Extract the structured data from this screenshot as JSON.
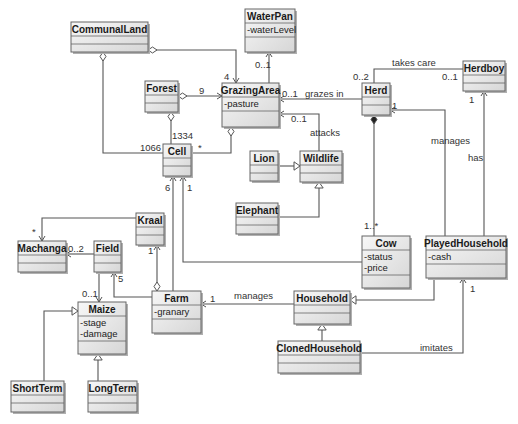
{
  "diagram": {
    "type": "UML class diagram",
    "classes": [
      {
        "id": "CommunalLand",
        "name": "CommunalLand",
        "attrs": [],
        "x": 71,
        "y": 22,
        "w": 77,
        "h": 30
      },
      {
        "id": "WaterPan",
        "name": "WaterPan",
        "attrs": [
          "-waterLevel"
        ],
        "x": 245,
        "y": 9,
        "w": 50,
        "h": 43
      },
      {
        "id": "Forest",
        "name": "Forest",
        "attrs": [],
        "x": 145,
        "y": 81,
        "w": 33,
        "h": 31
      },
      {
        "id": "GrazingArea",
        "name": "GrazingArea",
        "attrs": [
          "-pasture"
        ],
        "x": 222,
        "y": 83,
        "w": 57,
        "h": 44
      },
      {
        "id": "Herd",
        "name": "Herd",
        "attrs": [],
        "x": 362,
        "y": 83,
        "w": 28,
        "h": 32
      },
      {
        "id": "Herdboy",
        "name": "Herdboy",
        "attrs": [],
        "x": 463,
        "y": 61,
        "w": 42,
        "h": 30
      },
      {
        "id": "Cell",
        "name": "Cell",
        "attrs": [],
        "x": 163,
        "y": 144,
        "w": 28,
        "h": 32
      },
      {
        "id": "Lion",
        "name": "Lion",
        "attrs": [],
        "x": 250,
        "y": 151,
        "w": 28,
        "h": 30
      },
      {
        "id": "Wildlife",
        "name": "Wildlife",
        "attrs": [],
        "x": 300,
        "y": 151,
        "w": 42,
        "h": 31
      },
      {
        "id": "Elephant",
        "name": "Elephant",
        "attrs": [],
        "x": 236,
        "y": 203,
        "w": 42,
        "h": 31
      },
      {
        "id": "Kraal",
        "name": "Kraal",
        "attrs": [],
        "x": 136,
        "y": 213,
        "w": 28,
        "h": 32
      },
      {
        "id": "Machanga",
        "name": "Machanga",
        "attrs": [],
        "x": 18,
        "y": 241,
        "w": 48,
        "h": 31
      },
      {
        "id": "Field",
        "name": "Field",
        "attrs": [],
        "x": 94,
        "y": 241,
        "w": 27,
        "h": 31
      },
      {
        "id": "Cow",
        "name": "Cow",
        "attrs": [
          "-status",
          "-price"
        ],
        "x": 362,
        "y": 236,
        "w": 48,
        "h": 52
      },
      {
        "id": "PlayedHousehold",
        "name": "PlayedHousehold",
        "attrs": [
          "-cash"
        ],
        "x": 426,
        "y": 236,
        "w": 80,
        "h": 42
      },
      {
        "id": "Maize",
        "name": "Maize",
        "attrs": [
          "-stage",
          "-damage"
        ],
        "x": 78,
        "y": 302,
        "w": 48,
        "h": 52
      },
      {
        "id": "Farm",
        "name": "Farm",
        "attrs": [
          "-granary"
        ],
        "x": 152,
        "y": 291,
        "w": 49,
        "h": 42
      },
      {
        "id": "Household",
        "name": "Household",
        "attrs": [],
        "x": 294,
        "y": 291,
        "w": 56,
        "h": 33
      },
      {
        "id": "ClonedHousehold",
        "name": "ClonedHousehold",
        "attrs": [],
        "x": 278,
        "y": 341,
        "w": 82,
        "h": 32
      },
      {
        "id": "ShortTerm",
        "name": "ShortTerm",
        "attrs": [],
        "x": 11,
        "y": 381,
        "w": 53,
        "h": 31
      },
      {
        "id": "LongTerm",
        "name": "LongTerm",
        "attrs": [],
        "x": 88,
        "y": 381,
        "w": 49,
        "h": 31
      }
    ],
    "edges": [
      {
        "from": "CommunalLand",
        "to": "GrazingArea",
        "kind": "aggregation-navigable",
        "points": [
          [
            148,
            50
          ],
          [
            236,
            50
          ],
          [
            236,
            83
          ]
        ],
        "labels": [
          {
            "text": "4",
            "x": 224,
            "y": 80
          }
        ]
      },
      {
        "from": "CommunalLand",
        "to": "Cell",
        "kind": "aggregation",
        "points": [
          [
            103,
            52
          ],
          [
            103,
            153
          ],
          [
            163,
            153
          ]
        ],
        "labels": [
          {
            "text": "1066",
            "x": 140,
            "y": 151
          }
        ]
      },
      {
        "from": "WaterPan",
        "to": "GrazingArea",
        "kind": "association-navigable",
        "points": [
          [
            269,
            83
          ],
          [
            269,
            52
          ]
        ],
        "labels": [
          {
            "text": "0..1",
            "x": 255,
            "y": 68
          }
        ]
      },
      {
        "from": "Forest",
        "to": "GrazingArea",
        "kind": "aggregation-navigable",
        "points": [
          [
            178,
            96
          ],
          [
            222,
            96
          ]
        ],
        "labels": [
          {
            "text": "9",
            "x": 199,
            "y": 94
          }
        ]
      },
      {
        "from": "Forest",
        "to": "Cell",
        "kind": "aggregation",
        "points": [
          [
            171,
            112
          ],
          [
            171,
            144
          ]
        ],
        "labels": [
          {
            "text": "1334",
            "x": 172,
            "y": 139
          }
        ]
      },
      {
        "from": "GrazingArea",
        "to": "Cell",
        "kind": "aggregation",
        "points": [
          [
            231,
            127
          ],
          [
            231,
            153
          ],
          [
            191,
            153
          ]
        ],
        "labels": [
          {
            "text": "*",
            "x": 198,
            "y": 151
          }
        ]
      },
      {
        "from": "Herd",
        "to": "GrazingArea",
        "kind": "association-navigable",
        "label_name": "grazes in",
        "points": [
          [
            362,
            99
          ],
          [
            279,
            99
          ]
        ],
        "labels": [
          {
            "text": "0..1",
            "x": 282,
            "y": 97
          },
          {
            "text": "grazes in",
            "x": 305,
            "y": 97
          }
        ]
      },
      {
        "from": "Wildlife",
        "to": "GrazingArea",
        "kind": "association-navigable",
        "label_name": "attacks",
        "points": [
          [
            319,
            151
          ],
          [
            319,
            114
          ],
          [
            279,
            114
          ]
        ],
        "labels": [
          {
            "text": "0..1",
            "x": 291,
            "y": 122
          },
          {
            "text": "attacks",
            "x": 310,
            "y": 136
          }
        ]
      },
      {
        "from": "Herdboy",
        "to": "Herd",
        "kind": "association",
        "label_name": "takes care",
        "points": [
          [
            463,
            69
          ],
          [
            374,
            69
          ],
          [
            374,
            83
          ]
        ],
        "labels": [
          {
            "text": "takes care",
            "x": 392,
            "y": 66
          },
          {
            "text": "0..2",
            "x": 353,
            "y": 80
          },
          {
            "text": "0..1",
            "x": 442,
            "y": 80
          }
        ]
      },
      {
        "from": "Cow",
        "to": "Herd",
        "kind": "composition",
        "points": [
          [
            374,
            236
          ],
          [
            374,
            115
          ]
        ],
        "labels": [
          {
            "text": "1..*",
            "x": 364,
            "y": 229
          }
        ]
      },
      {
        "from": "PlayedHousehold",
        "to": "Herd",
        "kind": "association-navigable",
        "label_name": "manages",
        "points": [
          [
            445,
            236
          ],
          [
            445,
            110
          ],
          [
            390,
            110
          ]
        ],
        "labels": [
          {
            "text": "1",
            "x": 392,
            "y": 109
          },
          {
            "text": "manages",
            "x": 431,
            "y": 144
          }
        ]
      },
      {
        "from": "PlayedHousehold",
        "to": "Herdboy",
        "kind": "association-navigable",
        "label_name": "has",
        "points": [
          [
            484,
            236
          ],
          [
            484,
            91
          ]
        ],
        "labels": [
          {
            "text": "1",
            "x": 469,
            "y": 103
          },
          {
            "text": "has",
            "x": 468,
            "y": 161
          }
        ]
      },
      {
        "from": "Lion",
        "to": "Wildlife",
        "kind": "generalization",
        "points": [
          [
            278,
            166
          ],
          [
            300,
            166
          ]
        ],
        "labels": []
      },
      {
        "from": "Elephant",
        "to": "Wildlife",
        "kind": "generalization",
        "points": [
          [
            278,
            217
          ],
          [
            319,
            217
          ],
          [
            319,
            182
          ]
        ],
        "labels": []
      },
      {
        "from": "Cow",
        "to": "Cell",
        "kind": "association-navigable",
        "points": [
          [
            362,
            262
          ],
          [
            183,
            262
          ],
          [
            183,
            176
          ]
        ],
        "labels": [
          {
            "text": "1",
            "x": 187,
            "y": 191
          }
        ]
      },
      {
        "from": "Farm",
        "to": "Cell",
        "kind": "association-navigable",
        "points": [
          [
            173,
            291
          ],
          [
            173,
            176
          ]
        ],
        "labels": [
          {
            "text": "6",
            "x": 165,
            "y": 191
          }
        ]
      },
      {
        "from": "Kraal",
        "to": "Machanga",
        "kind": "association-navigable",
        "points": [
          [
            136,
            218
          ],
          [
            42,
            218
          ],
          [
            42,
            241
          ]
        ],
        "labels": [
          {
            "text": "*",
            "x": 32,
            "y": 235
          }
        ]
      },
      {
        "from": "Farm",
        "to": "Kraal",
        "kind": "aggregation-navigable",
        "points": [
          [
            157,
            291
          ],
          [
            157,
            245
          ]
        ],
        "labels": [
          {
            "text": "1",
            "x": 148,
            "y": 254
          }
        ]
      },
      {
        "from": "Field",
        "to": "Machanga",
        "kind": "association-navigable",
        "points": [
          [
            94,
            254
          ],
          [
            66,
            254
          ]
        ],
        "labels": [
          {
            "text": "0..2",
            "x": 68,
            "y": 252
          }
        ]
      },
      {
        "from": "Farm",
        "to": "Field",
        "kind": "association-navigable",
        "points": [
          [
            152,
            297
          ],
          [
            114,
            297
          ],
          [
            114,
            272
          ]
        ],
        "labels": [
          {
            "text": "5",
            "x": 118,
            "y": 282
          }
        ]
      },
      {
        "from": "Field",
        "to": "Maize",
        "kind": "association-navigable",
        "points": [
          [
            99,
            272
          ],
          [
            99,
            302
          ]
        ],
        "labels": [
          {
            "text": "0..1",
            "x": 82,
            "y": 297
          }
        ]
      },
      {
        "from": "ShortTerm",
        "to": "Maize",
        "kind": "generalization",
        "points": [
          [
            44,
            381
          ],
          [
            44,
            311
          ],
          [
            78,
            311
          ]
        ],
        "labels": []
      },
      {
        "from": "LongTerm",
        "to": "Maize",
        "kind": "generalization",
        "points": [
          [
            98,
            381
          ],
          [
            98,
            354
          ]
        ],
        "labels": []
      },
      {
        "from": "Household",
        "to": "Farm",
        "kind": "association-navigable",
        "label_name": "manages",
        "points": [
          [
            294,
            304
          ],
          [
            201,
            304
          ]
        ],
        "labels": [
          {
            "text": "1",
            "x": 210,
            "y": 302
          },
          {
            "text": "manages",
            "x": 234,
            "y": 299
          }
        ]
      },
      {
        "from": "PlayedHousehold",
        "to": "Household",
        "kind": "generalization",
        "points": [
          [
            434,
            278
          ],
          [
            434,
            300
          ],
          [
            350,
            300
          ]
        ],
        "labels": []
      },
      {
        "from": "ClonedHousehold",
        "to": "Household",
        "kind": "generalization",
        "points": [
          [
            322,
            341
          ],
          [
            322,
            324
          ]
        ],
        "labels": []
      },
      {
        "from": "ClonedHousehold",
        "to": "PlayedHousehold",
        "kind": "association-navigable",
        "label_name": "imitates",
        "points": [
          [
            360,
            353
          ],
          [
            463,
            353
          ],
          [
            463,
            278
          ]
        ],
        "labels": [
          {
            "text": "imitates",
            "x": 420,
            "y": 351
          },
          {
            "text": "1",
            "x": 470,
            "y": 292
          }
        ]
      }
    ]
  },
  "colors": {
    "class_fill_top": "#f4f4f4",
    "class_fill_bottom": "#d8d8d8",
    "class_border": "#666666",
    "shadow": "#b0b0b0",
    "edge": "#555555",
    "text": "#1a1a1a"
  }
}
